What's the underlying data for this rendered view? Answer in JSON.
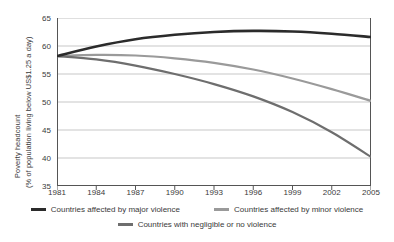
{
  "chart_data": {
    "type": "line",
    "title": "",
    "xlabel": "",
    "ylabel_line1": "Poverty headcount",
    "ylabel_line2": "(% of population living below US$1.25 a day)",
    "xlim": [
      1981,
      2005
    ],
    "ylim": [
      35,
      65
    ],
    "xticks": [
      1981,
      1984,
      1987,
      1990,
      1993,
      1996,
      1999,
      2002,
      2005
    ],
    "yticks": [
      35,
      40,
      45,
      50,
      55,
      60,
      65
    ],
    "grid": "horizontal",
    "legend_position": "bottom",
    "x": [
      1981,
      1984,
      1987,
      1990,
      1993,
      1996,
      1999,
      2002,
      2005
    ],
    "series": [
      {
        "name": "Countries affected by major violence",
        "color": "#2b2b2b",
        "width": 2.6,
        "values": [
          58.2,
          59.9,
          61.2,
          62.0,
          62.5,
          62.7,
          62.6,
          62.2,
          61.6
        ]
      },
      {
        "name": "Countries affected by minor violence",
        "color": "#9a9a9a",
        "width": 2.2,
        "values": [
          58.2,
          58.4,
          58.3,
          57.8,
          57.0,
          55.8,
          54.2,
          52.3,
          50.2
        ]
      },
      {
        "name": "Countries with negligible or no violence",
        "color": "#6e6e6e",
        "width": 2.2,
        "values": [
          58.2,
          57.6,
          56.5,
          55.0,
          53.2,
          51.0,
          48.2,
          44.6,
          40.2
        ]
      }
    ]
  },
  "legend": {
    "items": [
      {
        "label": "Countries affected by major violence",
        "color": "#2b2b2b"
      },
      {
        "label": "Countries affected by minor violence",
        "color": "#9a9a9a"
      },
      {
        "label": "Countries with negligible or no violence",
        "color": "#6e6e6e"
      }
    ]
  },
  "axes": {
    "axis_color": "#555555",
    "grid_color": "#b9b9b9"
  }
}
